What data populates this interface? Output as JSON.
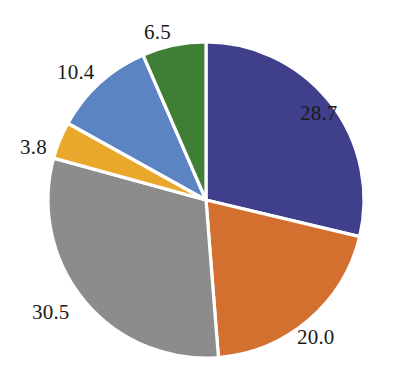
{
  "chart_data": {
    "type": "pie",
    "title": "",
    "subtitle": "",
    "xlabel": "",
    "ylabel": "",
    "grid": false,
    "legend": "none",
    "start_angle_deg": 0,
    "direction": "clockwise",
    "total": 99.9,
    "labels_shown": "values",
    "categories": [
      "Segment 1",
      "Segment 2",
      "Segment 3",
      "Segment 4",
      "Segment 5",
      "Segment 6"
    ],
    "values": [
      28.7,
      20.0,
      30.5,
      3.8,
      10.4,
      6.5
    ],
    "value_labels": [
      "28.7",
      "20.0",
      "30.5",
      "3.8",
      "10.4",
      "6.5"
    ],
    "colors": [
      "#3f3f8c",
      "#d4702f",
      "#8c8c8c",
      "#e9a72c",
      "#5b85c2",
      "#3f7f35"
    ],
    "slices": [
      {
        "name": "slice-dark-blue",
        "value": 28.7,
        "label": "28.7",
        "color": "#3f3f8c",
        "start_deg": 0.0,
        "end_deg": 103.42,
        "label_x": 300,
        "label_y": 103
      },
      {
        "name": "slice-orange",
        "value": 20.0,
        "label": "20.0",
        "color": "#d4702f",
        "start_deg": 103.42,
        "end_deg": 175.48,
        "label_x": 297,
        "label_y": 327
      },
      {
        "name": "slice-gray",
        "value": 30.5,
        "label": "30.5",
        "color": "#8c8c8c",
        "start_deg": 175.48,
        "end_deg": 285.37,
        "label_x": 32,
        "label_y": 302
      },
      {
        "name": "slice-amber",
        "value": 3.8,
        "label": "3.8",
        "color": "#e9a72c",
        "start_deg": 285.37,
        "end_deg": 299.06,
        "label_x": 20,
        "label_y": 137
      },
      {
        "name": "slice-medium-blue",
        "value": 10.4,
        "label": "10.4",
        "color": "#5b85c2",
        "start_deg": 299.06,
        "end_deg": 336.54,
        "label_x": 57,
        "label_y": 62
      },
      {
        "name": "slice-green",
        "value": 6.5,
        "label": "6.5",
        "color": "#3f7f35",
        "start_deg": 336.54,
        "end_deg": 360.0,
        "label_x": 144,
        "label_y": 22
      }
    ],
    "geometry": {
      "center_x": 206,
      "center_y": 200,
      "radius": 158,
      "separator_color": "#ffffff",
      "separator_width": 3.2,
      "background": "#ffffff"
    }
  }
}
